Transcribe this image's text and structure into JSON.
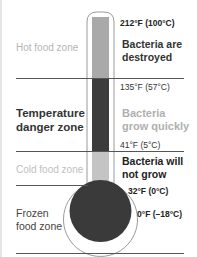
{
  "zones": [
    {
      "id": "hot",
      "label": "Hot food zone"
    },
    {
      "id": "danger",
      "label_lines": [
        "Temperature",
        "danger zone"
      ]
    },
    {
      "id": "cold",
      "label": "Cold food zone"
    },
    {
      "id": "frozen",
      "label_lines": [
        "Frozen",
        "food zone"
      ]
    }
  ],
  "temperatures": {
    "boiling": "212°F (100°C)",
    "hot_hold": "135°F (57°C)",
    "fridge": "41°F (5°C)",
    "freezing": "32°F (0°C)",
    "freezer": "0°F (–18°C)"
  },
  "descriptions": {
    "hot": [
      "Bacteria are",
      "destroyed"
    ],
    "danger": [
      "Bacteria",
      "grow quickly"
    ],
    "cold": [
      "Bacteria will",
      "not grow"
    ]
  },
  "colors": {
    "hot_fill": "#a9a9a9",
    "danger_fill": "#3c3c3c",
    "cold_fill": "#c4c4c4",
    "bulb_fill": "#3a3a3a",
    "outline": "#9a9a9a"
  }
}
